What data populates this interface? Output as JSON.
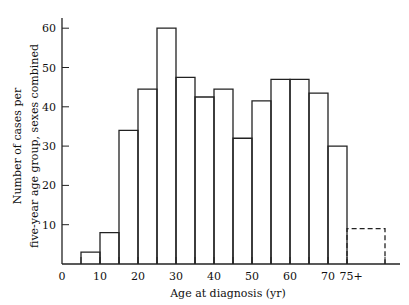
{
  "chart_data": {
    "type": "bar",
    "title": "",
    "xlabel": "Age at diagnosis (yr)",
    "ylabel_line1": "Number of cases per",
    "ylabel_line2": "five-year age group, sexes combined",
    "ylabel": "Number of cases per five-year age group, sexes combined",
    "x_tick_labels": [
      "0",
      "10",
      "20",
      "30",
      "40",
      "50",
      "60",
      "70",
      "75+"
    ],
    "x_tick_values": [
      0,
      10,
      20,
      30,
      40,
      50,
      60,
      70,
      75
    ],
    "y_tick_labels": [
      "10",
      "20",
      "30",
      "40",
      "50",
      "60"
    ],
    "y_tick_values": [
      10,
      20,
      30,
      40,
      50,
      60
    ],
    "xlim": [
      0,
      90
    ],
    "ylim": [
      0,
      63
    ],
    "grid": false,
    "legend": null,
    "categories": [
      "5-10",
      "10-15",
      "15-20",
      "20-25",
      "25-30",
      "30-35",
      "35-40",
      "40-45",
      "45-50",
      "50-55",
      "55-60",
      "60-65",
      "65-70",
      "70-75",
      "75+"
    ],
    "bins": [
      [
        5,
        10
      ],
      [
        10,
        15
      ],
      [
        15,
        20
      ],
      [
        20,
        25
      ],
      [
        25,
        30
      ],
      [
        30,
        35
      ],
      [
        35,
        40
      ],
      [
        40,
        45
      ],
      [
        45,
        50
      ],
      [
        50,
        55
      ],
      [
        55,
        60
      ],
      [
        60,
        65
      ],
      [
        65,
        70
      ],
      [
        70,
        75
      ],
      [
        75,
        85
      ]
    ],
    "values": [
      3,
      8,
      34,
      44.5,
      60,
      47.5,
      42.5,
      44.5,
      32,
      41.5,
      47,
      47,
      43.5,
      30,
      9
    ],
    "dashed": [
      false,
      false,
      false,
      false,
      false,
      false,
      false,
      false,
      false,
      false,
      false,
      false,
      false,
      false,
      true
    ],
    "annotations": [
      "75+ bin drawn with dashed outline"
    ]
  }
}
